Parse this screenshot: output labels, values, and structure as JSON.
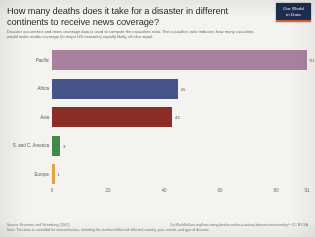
{
  "header": {
    "title": "How many deaths does it take for a disaster in different continents to receive news coverage?",
    "subtitle": "Disaster occurrence and news coverage data is used to compute the casualties ratio. The casualties ratio indicates how many casualties would make media coverage (in major US networks) equally likely, all else equal."
  },
  "logo": {
    "line1": "Our World",
    "line2": "in Data",
    "background": "#1d2d52",
    "accent": "#d9622b"
  },
  "footer": {
    "source": "Source: Eisensee and Strömberg (2007)",
    "note": "Note: This data is controlled for several factors, including the number killed and affected, country, year, month, and type of disaster.",
    "license": "OurWorldInData.org/how-many-deaths-make-a-natural-disaster-newsworthy/ • CC BY-SA"
  },
  "chart_data": {
    "type": "bar",
    "orientation": "horizontal",
    "title": "How many deaths does it take for a disaster in different continents to receive news coverage?",
    "xlabel": "",
    "ylabel": "",
    "xlim": [
      0,
      91
    ],
    "xticks": [
      "0",
      "20",
      "40",
      "60",
      "80",
      "91"
    ],
    "xtick_values": [
      0,
      20,
      40,
      60,
      80,
      91
    ],
    "grid": false,
    "legend": "none",
    "categories": [
      "Pacific",
      "Africa",
      "Asia",
      "S. and C. America",
      "Europe"
    ],
    "values": [
      91,
      45,
      43,
      3,
      1
    ],
    "value_labels": [
      "91",
      "45",
      "43",
      "3",
      "1"
    ],
    "colors": [
      "#a9819f",
      "#47548a",
      "#8b2e26",
      "#3f8a45",
      "#e0a43c"
    ],
    "bars": [
      {
        "category": "Pacific",
        "value": 91,
        "label": "91",
        "color": "#a9819f"
      },
      {
        "category": "Africa",
        "value": 45,
        "label": "45",
        "color": "#47548a"
      },
      {
        "category": "Asia",
        "value": 43,
        "label": "43",
        "color": "#8b2e26"
      },
      {
        "category": "S. and C. America",
        "value": 3,
        "label": "3",
        "color": "#3f8a45"
      },
      {
        "category": "Europe",
        "value": 1,
        "label": "1",
        "color": "#e0a43c"
      }
    ]
  }
}
